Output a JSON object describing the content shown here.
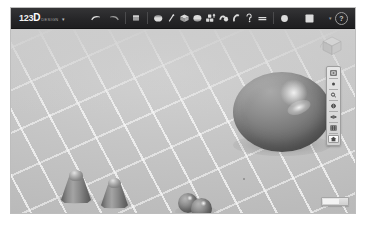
{
  "app": {
    "name": "123D Design",
    "logo_prefix": "123",
    "logo_d": "D",
    "logo_suffix": "DESIGN",
    "logo_caret": "▾"
  },
  "colors": {
    "toolbar_bg": "#2b2b2d",
    "viewport_bg": "#c4c4c4",
    "grid_line": "#fcfcfc",
    "object_gray": "#8a8a8a",
    "icon_light": "#dcdcdc"
  },
  "toolbar": {
    "groups": [
      {
        "name": "history",
        "items": [
          {
            "label": "Undo",
            "icon": "undo-arrow-icon"
          },
          {
            "label": "Redo",
            "icon": "redo-arrow-icon"
          }
        ]
      },
      {
        "name": "transform",
        "items": [
          {
            "label": "Transform",
            "icon": "transform-move-icon"
          }
        ]
      },
      {
        "name": "modeling",
        "items": [
          {
            "label": "Primitives",
            "icon": "primitives-box-icon"
          },
          {
            "label": "Sketch",
            "icon": "sketch-pencil-icon"
          },
          {
            "label": "Construct",
            "icon": "construct-extrude-icon"
          },
          {
            "label": "Modify",
            "icon": "modify-fillet-icon"
          },
          {
            "label": "Pattern",
            "icon": "pattern-array-icon"
          },
          {
            "label": "Grouping",
            "icon": "grouping-combine-icon"
          },
          {
            "label": "Combine",
            "icon": "combine-boolean-icon"
          },
          {
            "label": "Measure",
            "icon": "measure-ruler-icon"
          },
          {
            "label": "Text",
            "icon": "text-tool-icon"
          }
        ]
      },
      {
        "name": "material",
        "items": [
          {
            "label": "Material",
            "icon": "material-sphere-icon"
          }
        ]
      },
      {
        "name": "snap",
        "items": [
          {
            "label": "Snap",
            "icon": "snap-grid-icon"
          }
        ]
      }
    ],
    "help": {
      "label": "?",
      "icon": "help-question-icon"
    },
    "help_caret": "▾"
  },
  "viewport": {
    "viewcube": {
      "label": "ViewCube",
      "icon": "viewcube-icon",
      "face_top": "TOP",
      "face_front": "FRONT",
      "face_right": "RIGHT"
    },
    "nav_toolbar": {
      "items": [
        {
          "label": "Fit",
          "icon": "fit-to-screen-icon",
          "active": false
        },
        {
          "label": "Pan",
          "icon": "pan-hand-icon",
          "active": false
        },
        {
          "label": "Zoom",
          "icon": "zoom-magnifier-icon",
          "active": false
        },
        {
          "label": "Orbit",
          "icon": "orbit-rotate-icon",
          "active": false
        },
        {
          "label": "Look At",
          "icon": "look-at-eye-icon",
          "active": false
        },
        {
          "label": "Display Settings",
          "icon": "display-grid-icon",
          "active": false
        },
        {
          "label": "Home View",
          "icon": "home-house-icon",
          "active": true
        }
      ]
    },
    "bottom_widget": {
      "label": "Status bar",
      "icon": "progress-bar-icon"
    }
  },
  "scene": {
    "objects": [
      {
        "name": "ellipsoid-large",
        "type": "ellipsoid",
        "label": "Ellipsoid"
      },
      {
        "name": "cone-left",
        "type": "cone",
        "label": "Cone"
      },
      {
        "name": "cone-right",
        "type": "cone",
        "label": "Cone"
      },
      {
        "name": "sphere-back",
        "type": "sphere",
        "label": "Sphere"
      },
      {
        "name": "sphere-front",
        "type": "sphere",
        "label": "Sphere"
      }
    ],
    "grid": {
      "visible": true,
      "label": "Perspective grid floor"
    },
    "origin_marker": {
      "visible": true,
      "label": "Origin"
    }
  }
}
